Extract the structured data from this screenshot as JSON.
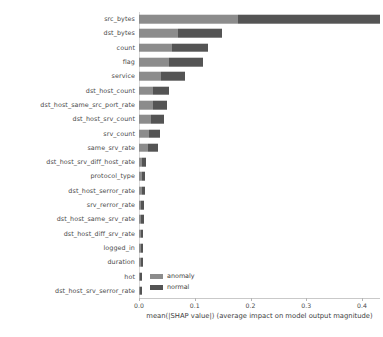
{
  "chart_data": {
    "type": "bar",
    "orientation": "horizontal",
    "stacked": true,
    "title": "",
    "xlabel": "mean(|SHAP value|) (average impact on model output magnitude)",
    "ylabel": "",
    "xlim": [
      0.0,
      0.433
    ],
    "xticks": [
      0.0,
      0.1,
      0.2,
      0.3,
      0.4
    ],
    "xticklabels": [
      "0.0",
      "0.1",
      "0.2",
      "0.3",
      "0.4"
    ],
    "grid": false,
    "legend_position": "lower-left-inside",
    "legend": [
      "anomaly",
      "normal"
    ],
    "colors": {
      "anomaly": "#8c8c8c",
      "normal": "#545454"
    },
    "categories": [
      "src_bytes",
      "dst_bytes",
      "count",
      "flag",
      "service",
      "dst_host_count",
      "dst_host_same_src_port_rate",
      "dst_host_srv_count",
      "srv_count",
      "same_srv_rate",
      "dst_host_srv_diff_host_rate",
      "protocol_type",
      "dst_host_serror_rate",
      "srv_rerror_rate",
      "dst_host_same_srv_rate",
      "dst_host_diff_srv_rate",
      "logged_in",
      "duration",
      "hot",
      "dst_host_srv_serror_rate"
    ],
    "series": [
      {
        "name": "anomaly",
        "values": [
          0.178,
          0.07,
          0.059,
          0.054,
          0.04,
          0.026,
          0.025,
          0.022,
          0.018,
          0.016,
          0.006,
          0.005,
          0.005,
          0.004,
          0.004,
          0.004,
          0.003,
          0.003,
          0.002,
          0.002
        ]
      },
      {
        "name": "normal",
        "values": [
          0.255,
          0.078,
          0.064,
          0.061,
          0.042,
          0.027,
          0.026,
          0.023,
          0.02,
          0.018,
          0.007,
          0.006,
          0.006,
          0.005,
          0.005,
          0.004,
          0.004,
          0.004,
          0.003,
          0.003
        ]
      }
    ],
    "totals": [
      0.433,
      0.148,
      0.123,
      0.115,
      0.082,
      0.053,
      0.051,
      0.045,
      0.038,
      0.034,
      0.013,
      0.011,
      0.011,
      0.009,
      0.009,
      0.008,
      0.007,
      0.007,
      0.005,
      0.005
    ]
  }
}
